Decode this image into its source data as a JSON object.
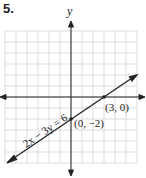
{
  "problem": {
    "number": "5."
  },
  "chart_data": {
    "type": "line",
    "title": "",
    "xlabel": "",
    "ylabel": "y",
    "xlim": [
      -6,
      6
    ],
    "ylim": [
      -6,
      6
    ],
    "grid": true,
    "series": [
      {
        "name": "2x − 3y = 6",
        "equation": "2x − 3y = 6",
        "x": [
          -6,
          6
        ],
        "y": [
          -6,
          2
        ]
      }
    ],
    "points": [
      {
        "x": 3,
        "y": 0,
        "label": "(3, 0)"
      },
      {
        "x": 0,
        "y": -2,
        "label": "(0, −2)"
      }
    ],
    "annotations": [
      "2x − 3y = 6",
      "(3, 0)",
      "(0, −2)"
    ]
  },
  "labels": {
    "y_axis": "y",
    "equation": "2x − 3y = 6",
    "point_x_intercept": "(3, 0)",
    "point_y_intercept": "(0, −2)"
  }
}
